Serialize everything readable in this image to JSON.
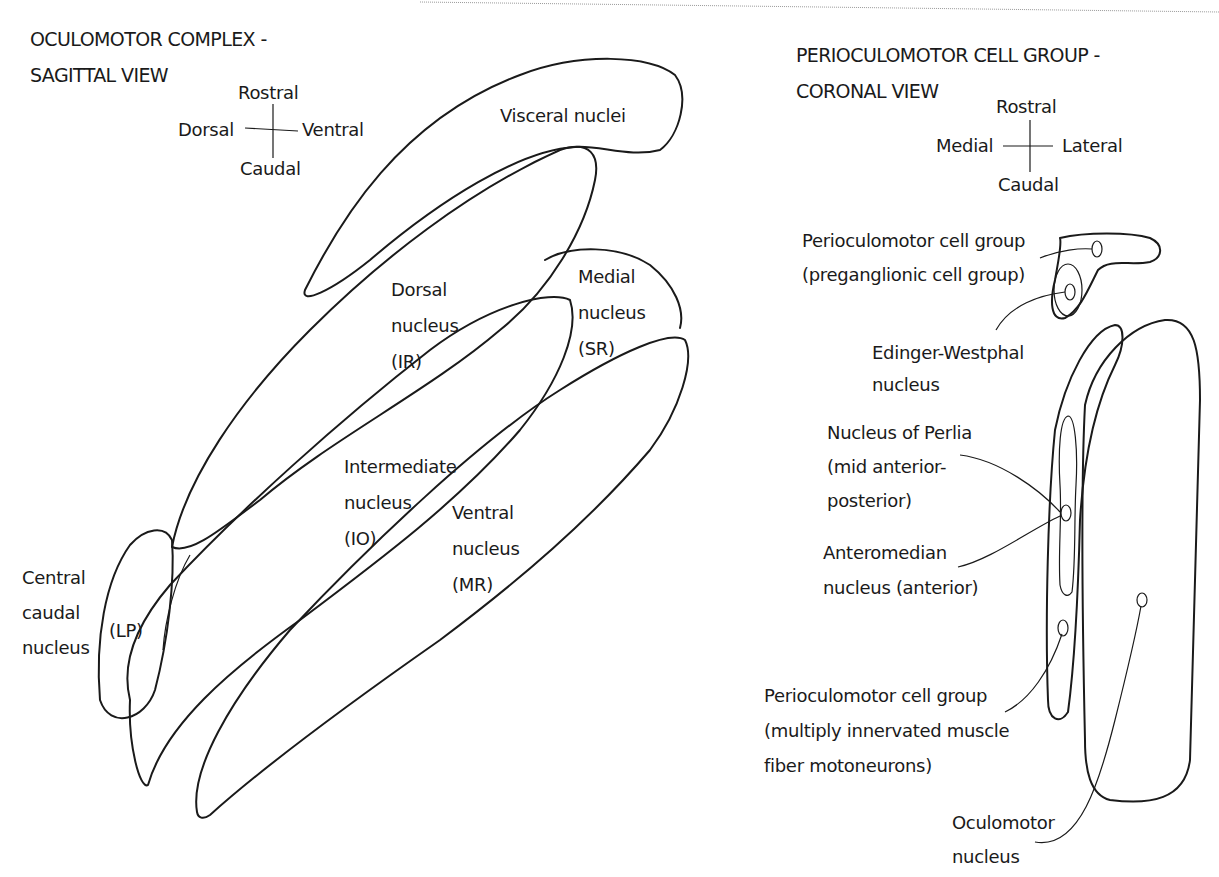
{
  "sagittal": {
    "title_line1": "OCULOMOTOR COMPLEX -",
    "title_line2": "SAGITTAL VIEW",
    "compass": {
      "top": "Rostral",
      "left": "Dorsal",
      "right": "Ventral",
      "bottom": "Caudal"
    },
    "labels": {
      "visceral": "Visceral nuclei",
      "dorsal": [
        "Dorsal",
        "nucleus",
        "(IR)"
      ],
      "medial": [
        "Medial",
        "nucleus",
        "(SR)"
      ],
      "intermediate": [
        "Intermediate",
        "nucleus",
        "(IO)"
      ],
      "ventral": [
        "Ventral",
        "nucleus",
        "(MR)"
      ],
      "central_caudal": [
        "Central",
        "caudal",
        "nucleus"
      ],
      "lp": "(LP)"
    }
  },
  "coronal": {
    "title_line1": "PERIOCULOMOTOR CELL GROUP -",
    "title_line2": "CORONAL VIEW",
    "compass": {
      "top": "Rostral",
      "left": "Medial",
      "right": "Lateral",
      "bottom": "Caudal"
    },
    "labels": {
      "preganglionic": [
        "Perioculomotor cell group",
        "(preganglionic cell group)"
      ],
      "edinger": [
        "Edinger-Westphal",
        "nucleus"
      ],
      "perlia": [
        "Nucleus of Perlia",
        "(mid anterior-",
        "posterior)"
      ],
      "anteromedian": [
        "Anteromedian",
        "nucleus (anterior)"
      ],
      "mif": [
        "Perioculomotor cell group",
        "(multiply innervated muscle",
        "fiber motoneurons)"
      ],
      "oculomotor": [
        "Oculomotor",
        "nucleus"
      ]
    }
  },
  "colors": {
    "ink": "#1a1a1a",
    "background": "#ffffff"
  }
}
